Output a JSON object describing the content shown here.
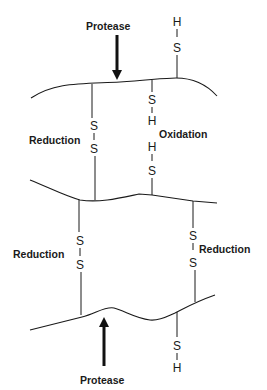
{
  "labels": {
    "protease_top": "Protease",
    "protease_bottom": "Protease",
    "reduction_left_upper": "Reduction",
    "oxidation": "Oxidation",
    "reduction_left_lower": "Reduction",
    "reduction_right_lower": "Reduction"
  },
  "atoms": {
    "sulfur": "S",
    "hydrogen": "H"
  }
}
